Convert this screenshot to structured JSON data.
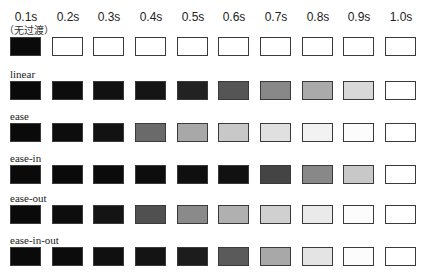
{
  "columns": [
    "0.1s",
    "0.2s",
    "0.3s",
    "0.4s",
    "0.5s",
    "0.6s",
    "0.7s",
    "0.8s",
    "0.9s",
    "1.0s"
  ],
  "first_row_note": "（无过渡）",
  "rows": [
    {
      "label": "",
      "colors": [
        "#0a0a0a",
        "#ffffff",
        "#ffffff",
        "#ffffff",
        "#ffffff",
        "#ffffff",
        "#ffffff",
        "#ffffff",
        "#ffffff",
        "#ffffff"
      ]
    },
    {
      "label": "linear",
      "colors": [
        "#0a0a0a",
        "#0d0d0d",
        "#111111",
        "#151515",
        "#222222",
        "#555555",
        "#888888",
        "#aaaaaa",
        "#d8d8d8",
        "#ffffff"
      ]
    },
    {
      "label": "ease",
      "colors": [
        "#0a0a0a",
        "#0d0d0d",
        "#121212",
        "#6a6a6a",
        "#a8a8a8",
        "#c8c8c8",
        "#e0e0e0",
        "#f2f2f2",
        "#fcfcfc",
        "#ffffff"
      ]
    },
    {
      "label": "ease-in",
      "colors": [
        "#0a0a0a",
        "#0a0a0a",
        "#0b0b0b",
        "#0d0d0d",
        "#0f0f0f",
        "#111111",
        "#444444",
        "#888888",
        "#c8c8c8",
        "#ffffff"
      ]
    },
    {
      "label": "ease-out",
      "colors": [
        "#0a0a0a",
        "#0d0d0d",
        "#141414",
        "#505050",
        "#8a8a8a",
        "#b0b0b0",
        "#d0d0d0",
        "#eaeaea",
        "#fcfcfc",
        "#ffffff"
      ]
    },
    {
      "label": "ease-in-out",
      "colors": [
        "#0a0a0a",
        "#0c0c0c",
        "#101010",
        "#141414",
        "#1c1c1c",
        "#5a5a5a",
        "#a8a8a8",
        "#e4e4e4",
        "#fcfcfc",
        "#ffffff"
      ]
    }
  ]
}
